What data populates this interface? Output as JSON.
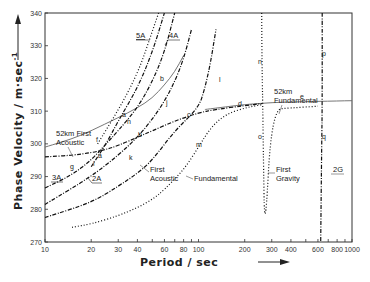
{
  "chart_data": {
    "type": "line",
    "title": "",
    "xlabel": "Period / sec",
    "ylabel": "Phase Velocity / m·sec⁻¹",
    "xscale": "log",
    "xlim": [
      10,
      1000
    ],
    "ylim": [
      270,
      340
    ],
    "grid": false,
    "legend": "none (inline annotations)",
    "x_ticks": [
      10,
      20,
      30,
      40,
      60,
      80,
      100,
      200,
      300,
      400,
      600,
      800,
      1000
    ],
    "x_tick_labels": [
      "10",
      "20",
      "30",
      "40",
      "60",
      "80",
      "100",
      "200",
      "300",
      "400",
      "600",
      "800",
      "1000"
    ],
    "y_ticks": [
      270,
      280,
      290,
      300,
      310,
      320,
      330,
      340
    ],
    "y_tick_labels": [
      "270",
      "280",
      "290",
      "300",
      "310",
      "320",
      "330",
      "340"
    ],
    "series": [
      {
        "name": "52km First Acoustic",
        "style": "solid",
        "x": [
          10,
          15,
          20,
          30,
          40,
          50,
          60,
          70,
          80
        ],
        "y": [
          299,
          301.5,
          304,
          308,
          311,
          314,
          318,
          322,
          327
        ]
      },
      {
        "name": "52km Fundamental",
        "style": "solid",
        "x": [
          110,
          150,
          200,
          260,
          300,
          400,
          600,
          800,
          1000
        ],
        "y": [
          310.5,
          311.3,
          312,
          312.4,
          312.6,
          312.8,
          313,
          313.1,
          313.2
        ]
      },
      {
        "name": "Fundamental (upper branch a-b-c-d)",
        "style": "dash-dot",
        "x": [
          10,
          15,
          20,
          25,
          30,
          40,
          50,
          70,
          100,
          130,
          200,
          260
        ],
        "y": [
          296,
          296.5,
          297.3,
          298.3,
          299.5,
          302,
          304,
          307,
          309.5,
          310.5,
          311.7,
          312.3
        ]
      },
      {
        "name": "Fundamental (lower branch m)",
        "style": "dotted",
        "x": [
          15,
          20,
          30,
          40,
          50,
          60,
          80,
          100,
          120,
          150,
          200,
          260
        ],
        "y": [
          274.5,
          275.5,
          278,
          280.5,
          283,
          286,
          292,
          299,
          305,
          309,
          311,
          312
        ]
      },
      {
        "name": "First Acoustic (k-l)",
        "style": "dash-dot",
        "x": [
          10,
          20,
          30,
          40,
          50,
          70,
          100,
          110,
          120,
          130
        ],
        "y": [
          277.5,
          282,
          287,
          291,
          295,
          304,
          311,
          317,
          325,
          335
        ]
      },
      {
        "name": "2A (i-j)",
        "style": "dash-dot",
        "x": [
          10,
          20,
          30,
          40,
          50,
          60,
          70,
          80,
          90
        ],
        "y": [
          281.5,
          290,
          296.5,
          302,
          307.5,
          313,
          319,
          326,
          335
        ]
      },
      {
        "name": "3A (g-h)",
        "style": "dash-dot",
        "x": [
          10,
          15,
          20,
          25,
          30,
          40,
          50,
          60,
          70
        ],
        "y": [
          286.5,
          290.5,
          295,
          300,
          304,
          311,
          319,
          328,
          340
        ]
      },
      {
        "name": "4A (f)",
        "style": "dash-dot",
        "x": [
          20,
          25,
          30,
          40,
          50,
          60
        ],
        "y": [
          293,
          300,
          307,
          317,
          328,
          340
        ]
      },
      {
        "name": "5A",
        "style": "dotted",
        "x": [
          22,
          28,
          35,
          42,
          48,
          55
        ],
        "y": [
          300,
          308,
          316,
          324,
          332,
          340
        ]
      },
      {
        "name": "First Gravity (n-o)",
        "style": "dotted/dash-dot",
        "x": [
          258,
          260,
          262,
          264,
          270,
          300,
          400,
          600
        ],
        "y": [
          340,
          320,
          312,
          300,
          270,
          310.5,
          311,
          311.5
        ]
      },
      {
        "name": "2G (p-q)",
        "style": "dash-dot",
        "x": [
          640,
          640,
          635,
          625
        ],
        "y": [
          340,
          313,
          300,
          270
        ]
      }
    ],
    "annotations": [
      "5A",
      "4A",
      "3A",
      "2A",
      "52km First Acoustic",
      "52km Fundamental",
      "First Acoustic",
      "Fundamental",
      "First Gravity",
      "2G",
      "a",
      "b",
      "c",
      "d",
      "e",
      "f",
      "g",
      "h",
      "i",
      "j",
      "k",
      "l",
      "m",
      "n",
      "o",
      "p",
      "q"
    ]
  },
  "labels": {
    "xlabel": "Period / sec",
    "ylabel": "Phase Velocity / m·sec",
    "ylabel_sup": "-1",
    "ann_5A": "5A",
    "ann_4A": "4A",
    "ann_3A": "3A",
    "ann_2A": "2A",
    "ann_52_first_1": "52km  First",
    "ann_52_first_2": "Acoustic",
    "ann_52_fund_1": "52km",
    "ann_52_fund_2": "Fundamental",
    "ann_first_acoustic_1": "First",
    "ann_first_acoustic_2": "Acoustic",
    "ann_fundamental": "Fundamental",
    "ann_first_gravity_1": "First",
    "ann_first_gravity_2": "Gravity",
    "ann_2G": "2G",
    "letters": {
      "a": "a",
      "b": "b",
      "c": "c",
      "d": "d",
      "e": "e",
      "f": "f",
      "g": "g",
      "h": "h",
      "i": "i",
      "j": "j",
      "k": "k",
      "l": "l",
      "m": "m",
      "n": "n",
      "o": "o",
      "p": "p",
      "q": "q"
    }
  }
}
